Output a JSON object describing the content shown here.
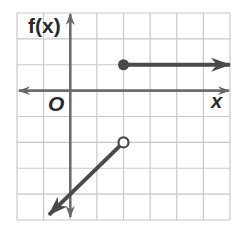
{
  "chart_data": {
    "type": "line",
    "title": "",
    "xlabel": "x",
    "ylabel": "f(x)",
    "origin_label": "O",
    "xlim": [
      -2,
      6
    ],
    "ylim": [
      -5,
      3
    ],
    "grid": true,
    "grid_step": 1,
    "series": [
      {
        "name": "upper ray",
        "points": [
          [
            2,
            1
          ],
          [
            6,
            1
          ]
        ],
        "start_point": {
          "x": 2,
          "y": 1,
          "style": "closed"
        },
        "end": "arrow"
      },
      {
        "name": "lower ray",
        "points": [
          [
            2,
            -2
          ],
          [
            -0.8,
            -4.8
          ]
        ],
        "start_point": {
          "x": 2,
          "y": -2,
          "style": "open"
        },
        "slope": 1,
        "end": "arrow"
      }
    ]
  },
  "colors": {
    "grid": "#c8c8c8",
    "axis": "#6a6a6a",
    "graph": "#4a4a4a"
  }
}
